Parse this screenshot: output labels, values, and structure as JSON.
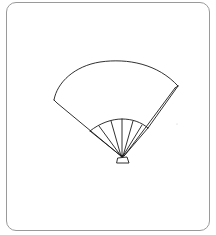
{
  "figure": {
    "subject": "folding fan line drawing",
    "stroke_color": "#1a1a1a",
    "frame_color": "#9a9a9a",
    "background": "#ffffff",
    "rib_count": 7
  }
}
